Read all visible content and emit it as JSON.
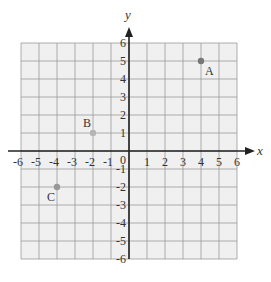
{
  "chart_data": {
    "type": "scatter",
    "title": "",
    "xlabel": "x",
    "ylabel": "y",
    "xlim": [
      -6,
      6
    ],
    "ylim": [
      -6,
      6
    ],
    "grid": true,
    "x_ticks": [
      "-6",
      "-5",
      "-4",
      "-3",
      "-2",
      "-1",
      "0",
      "1",
      "2",
      "3",
      "4",
      "5",
      "6"
    ],
    "y_ticks": [
      "6",
      "5",
      "4",
      "3",
      "2",
      "1",
      "-1",
      "-2",
      "-3",
      "-4",
      "-5",
      "-6"
    ],
    "points": [
      {
        "label": "A",
        "x": 4,
        "y": 5,
        "color": "#777777"
      },
      {
        "label": "B",
        "x": -2,
        "y": 1,
        "color": "#b5b5b5"
      },
      {
        "label": "C",
        "x": -4,
        "y": -2,
        "color": "#999999"
      }
    ]
  },
  "colors": {
    "grid_fill": "#f0f0f0",
    "grid_line": "#9a9a9a",
    "axis": "#222222"
  }
}
